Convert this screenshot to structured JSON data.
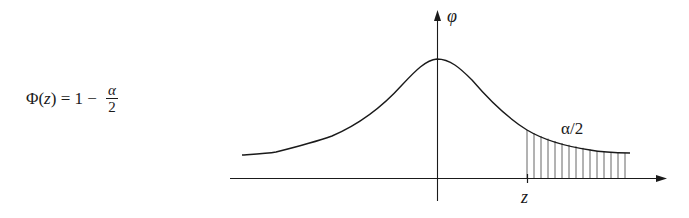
{
  "formula": {
    "lhs_func": "Φ(",
    "lhs_var": "z",
    "lhs_close": ")",
    "equals": " = 1 − ",
    "numerator": "α",
    "denominator": "2"
  },
  "diagram": {
    "y_axis_label": "φ",
    "x_tick_label": "z",
    "tail_area_label": "α/2",
    "colors": {
      "stroke": "#1a1a1a",
      "hatch": "#555555",
      "background": "#ffffff"
    }
  }
}
